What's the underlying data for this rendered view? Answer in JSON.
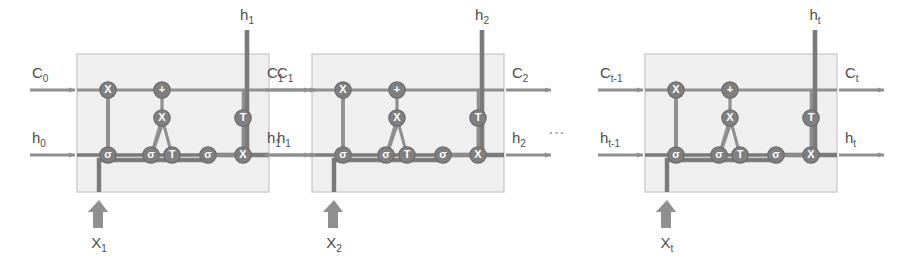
{
  "diagram": {
    "type": "lstm-unrolled",
    "cell_count_visible": 3,
    "ellipsis": "...",
    "colors": {
      "cell_fill": "#efefef",
      "cell_border": "#c9c9c9",
      "wire": "#8f8f8f",
      "wire_dark": "#7a7a7a",
      "node_fill": "#7f7f7f",
      "node_stroke": "#6b6b6b",
      "node_text": "#ffffff",
      "label_text": "#4d4d4d",
      "arrow": "#8f8f8f",
      "background": "#ffffff"
    },
    "node_glyphs": {
      "multiply": "X",
      "add": "+",
      "sigmoid": "σ",
      "tanh": "T"
    }
  },
  "cells": [
    {
      "index": 1,
      "input_state_label": "C",
      "input_state_sub": "0",
      "input_hidden_label": "h",
      "input_hidden_sub": "0",
      "output_state_label": "C",
      "output_state_sub": "1",
      "output_hidden_label": "h",
      "output_hidden_sub": "1",
      "top_output_label": "h",
      "top_output_sub": "1",
      "input_x_label": "X",
      "input_x_sub": "1",
      "nodes": [
        {
          "name": "forget-multiply",
          "glyph": "X"
        },
        {
          "name": "forget-gate-sigmoid",
          "glyph": "σ"
        },
        {
          "name": "input-gate-sigmoid",
          "glyph": "σ"
        },
        {
          "name": "candidate-tanh",
          "glyph": "T"
        },
        {
          "name": "input-multiply",
          "glyph": "X"
        },
        {
          "name": "state-add",
          "glyph": "+"
        },
        {
          "name": "output-gate-sigmoid",
          "glyph": "σ"
        },
        {
          "name": "output-multiply",
          "glyph": "X"
        },
        {
          "name": "output-tanh",
          "glyph": "T"
        }
      ]
    },
    {
      "index": 2,
      "input_state_label": "C",
      "input_state_sub": "1",
      "input_hidden_label": "h",
      "input_hidden_sub": "1",
      "output_state_label": "C",
      "output_state_sub": "2",
      "output_hidden_label": "h",
      "output_hidden_sub": "2",
      "top_output_label": "h",
      "top_output_sub": "2",
      "input_x_label": "X",
      "input_x_sub": "2",
      "nodes": [
        {
          "name": "forget-multiply",
          "glyph": "X"
        },
        {
          "name": "forget-gate-sigmoid",
          "glyph": "σ"
        },
        {
          "name": "input-gate-sigmoid",
          "glyph": "σ"
        },
        {
          "name": "candidate-tanh",
          "glyph": "T"
        },
        {
          "name": "input-multiply",
          "glyph": "X"
        },
        {
          "name": "state-add",
          "glyph": "+"
        },
        {
          "name": "output-gate-sigmoid",
          "glyph": "σ"
        },
        {
          "name": "output-multiply",
          "glyph": "X"
        },
        {
          "name": "output-tanh",
          "glyph": "T"
        }
      ]
    },
    {
      "index": 3,
      "input_state_label": "C",
      "input_state_sub": "t-1",
      "input_hidden_label": "h",
      "input_hidden_sub": "t-1",
      "output_state_label": "C",
      "output_state_sub": "t",
      "output_hidden_label": "h",
      "output_hidden_sub": "t",
      "top_output_label": "h",
      "top_output_sub": "t",
      "input_x_label": "X",
      "input_x_sub": "t",
      "nodes": [
        {
          "name": "forget-multiply",
          "glyph": "X"
        },
        {
          "name": "forget-gate-sigmoid",
          "glyph": "σ"
        },
        {
          "name": "input-gate-sigmoid",
          "glyph": "σ"
        },
        {
          "name": "candidate-tanh",
          "glyph": "T"
        },
        {
          "name": "input-multiply",
          "glyph": "X"
        },
        {
          "name": "state-add",
          "glyph": "+"
        },
        {
          "name": "output-gate-sigmoid",
          "glyph": "σ"
        },
        {
          "name": "output-multiply",
          "glyph": "X"
        },
        {
          "name": "output-tanh",
          "glyph": "T"
        }
      ]
    }
  ]
}
